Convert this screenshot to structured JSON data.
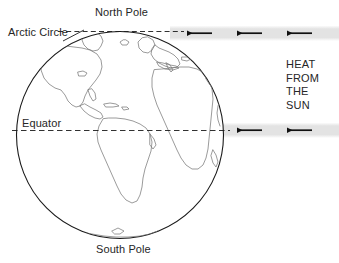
{
  "diagram": {
    "background_color": "#ffffff",
    "line_color": "#1a1a1a",
    "band_color": "#e3e3e3",
    "labels": {
      "north_pole": "North Pole",
      "arctic_circle": "Arctic Circle",
      "equator": "Equator",
      "south_pole": "South Pole"
    },
    "caption": {
      "line1": "HEAT",
      "line2": "FROM",
      "line3": "THE",
      "line4": "SUN"
    },
    "globe": {
      "center_x": 120,
      "center_y": 135,
      "radius": 104,
      "equator_y": 135,
      "arctic_circle_y": 32
    },
    "rays": {
      "direction": "leftward",
      "top_band": {
        "y_center": 33,
        "height": 15,
        "x_start": 170,
        "x_end": 339,
        "arrow_count": 3
      },
      "equator_band": {
        "y_center": 130,
        "height": 15,
        "x_start": 224,
        "x_end": 339,
        "arrow_count": 2
      }
    }
  }
}
